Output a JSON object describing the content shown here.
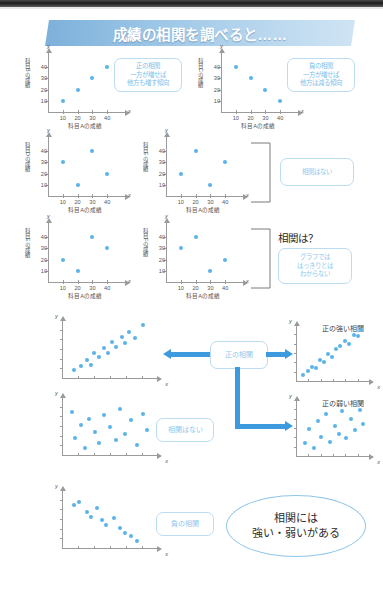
{
  "banner": {
    "title": "成績の相関を調べると……"
  },
  "axes": {
    "x_symbol": "x",
    "y_symbol": "y",
    "ticks": [
      "10",
      "20",
      "30",
      "40"
    ],
    "subject_a": "科目Aの成績"
  },
  "mini_charts": [
    {
      "id": "chart-positive",
      "ylabel": "科目Bの成績",
      "xlabel": "科目Aの成績",
      "points": [
        [
          10,
          10
        ],
        [
          20,
          20
        ],
        [
          30,
          30
        ],
        [
          40,
          40
        ]
      ],
      "note": [
        "正の相関",
        "一方が増せば",
        "他方も増す傾向"
      ]
    },
    {
      "id": "chart-negative",
      "ylabel": "科目Cの成績",
      "xlabel": "科目Aの成績",
      "points": [
        [
          10,
          40
        ],
        [
          20,
          30
        ],
        [
          30,
          20
        ],
        [
          40,
          10
        ]
      ],
      "note": [
        "負の相関",
        "一方が増せば",
        "他方は減る傾向"
      ]
    },
    {
      "id": "chart-none-d",
      "ylabel": "科目Dの成績",
      "xlabel": "科目Aの成績",
      "points": [
        [
          10,
          30
        ],
        [
          20,
          10
        ],
        [
          30,
          40
        ],
        [
          40,
          20
        ]
      ],
      "note": []
    },
    {
      "id": "chart-none-e",
      "ylabel": "科目Eの成績",
      "xlabel": "科目Aの成績",
      "points": [
        [
          10,
          20
        ],
        [
          20,
          40
        ],
        [
          30,
          10
        ],
        [
          40,
          30
        ]
      ],
      "note": []
    },
    {
      "id": "chart-unclear-e",
      "ylabel": "科目Eの成績",
      "xlabel": "科目Aの成績",
      "points": [
        [
          10,
          20
        ],
        [
          20,
          10
        ],
        [
          30,
          40
        ],
        [
          40,
          30
        ]
      ],
      "note": []
    },
    {
      "id": "chart-unclear-f",
      "ylabel": "科目Fの成績",
      "xlabel": "科目Aの成績",
      "points": [
        [
          10,
          30
        ],
        [
          20,
          40
        ],
        [
          30,
          10
        ],
        [
          40,
          20
        ]
      ],
      "note": []
    }
  ],
  "labels": {
    "no_correlation": "相関はない",
    "correlation_q": "相関は？",
    "unclear": [
      "グラフでは",
      "はっきりとは",
      "わからない"
    ],
    "positive_correlation": "正の相関",
    "negative_correlation": "負の相関",
    "strong_positive": "正の強い相関",
    "weak_positive": "正の弱い相関"
  },
  "conclusion": {
    "line1": "相関には",
    "line2": "強い・弱いがある"
  },
  "colors": {
    "banner_blue": "#7db0da",
    "dot_blue": "#5cb3e8",
    "arrow_blue": "#3d9ade",
    "callout_border": "#bcdcf2",
    "callout_text": "#7cc0ea",
    "axis_gray": "#9a9a9a"
  },
  "chart_data": {
    "type": "scatter",
    "title": "成績の相関を調べると……",
    "xlabel": "科目Aの成績",
    "ylabel": "各科目の成績",
    "xlim": [
      0,
      50
    ],
    "ylim": [
      0,
      50
    ],
    "grid": false,
    "panels": [
      {
        "name": "科目B 正の相関",
        "ylabel": "科目Bの成績",
        "x": [
          10,
          20,
          30,
          40
        ],
        "y": [
          10,
          20,
          30,
          40
        ],
        "annotation": "正の相関 一方が増せば 他方も増す傾向"
      },
      {
        "name": "科目C 負の相関",
        "ylabel": "科目Cの成績",
        "x": [
          10,
          20,
          30,
          40
        ],
        "y": [
          40,
          30,
          20,
          10
        ],
        "annotation": "負の相関 一方が増せば 他方は減る傾向"
      },
      {
        "name": "科目D 相関なし",
        "ylabel": "科目Dの成績",
        "x": [
          10,
          20,
          30,
          40
        ],
        "y": [
          30,
          10,
          40,
          20
        ],
        "annotation": "相関はない"
      },
      {
        "name": "科目E 相関なし",
        "ylabel": "科目Eの成績",
        "x": [
          10,
          20,
          30,
          40
        ],
        "y": [
          20,
          40,
          10,
          30
        ],
        "annotation": "相関はない"
      },
      {
        "name": "科目E 相関は？",
        "ylabel": "科目Eの成績",
        "x": [
          10,
          20,
          30,
          40
        ],
        "y": [
          20,
          10,
          40,
          30
        ],
        "annotation": "グラフでははっきりとはわからない"
      },
      {
        "name": "科目F 相関は？",
        "ylabel": "科目Fの成績",
        "x": [
          10,
          20,
          30,
          40
        ],
        "y": [
          30,
          40,
          10,
          20
        ],
        "annotation": "グラフでははっきりとはわからない"
      }
    ],
    "clouds": [
      {
        "name": "正の相関",
        "x": [
          12,
          20,
          26,
          30,
          33,
          38,
          44,
          48,
          52,
          56,
          62,
          66,
          70,
          76,
          84
        ],
        "y": [
          10,
          14,
          22,
          16,
          30,
          26,
          36,
          30,
          44,
          38,
          50,
          42,
          56,
          48,
          64
        ]
      },
      {
        "name": "正の強い相関",
        "x": [
          10,
          16,
          22,
          27,
          32,
          38,
          43,
          48,
          54,
          60,
          66,
          72,
          78,
          84,
          88
        ],
        "y": [
          8,
          12,
          18,
          16,
          26,
          24,
          34,
          30,
          40,
          44,
          50,
          46,
          58,
          56,
          64
        ]
      },
      {
        "name": "相関はない",
        "x": [
          10,
          14,
          20,
          24,
          28,
          34,
          38,
          44,
          50,
          56,
          60,
          66,
          72,
          78,
          84,
          88
        ],
        "y": [
          52,
          20,
          36,
          8,
          44,
          28,
          14,
          48,
          34,
          18,
          56,
          26,
          42,
          12,
          50,
          30
        ]
      },
      {
        "name": "正の弱い相関",
        "x": [
          12,
          18,
          24,
          30,
          34,
          40,
          46,
          52,
          58,
          62,
          68,
          74,
          80,
          86,
          90
        ],
        "y": [
          16,
          34,
          10,
          44,
          24,
          52,
          18,
          38,
          28,
          56,
          22,
          46,
          32,
          58,
          40
        ]
      },
      {
        "name": "負の相関",
        "x": [
          12,
          18,
          26,
          30,
          36,
          42,
          46,
          54,
          60,
          66,
          72,
          78
        ],
        "y": [
          52,
          56,
          44,
          38,
          48,
          34,
          28,
          36,
          24,
          18,
          14,
          8
        ]
      }
    ],
    "conclusion": "相関には 強い・弱いがある"
  }
}
